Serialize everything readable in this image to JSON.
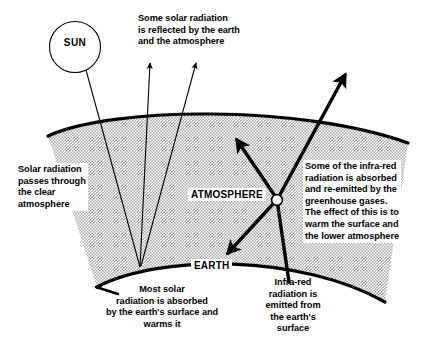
{
  "diagram": {
    "labels": {
      "sun": "SUN",
      "atmosphere": "ATMOSPHERE",
      "earth": "EARTH"
    },
    "annotations": {
      "top": "Some solar radiation\nis reflected by the earth\nand the atmosphere",
      "left": "Solar radiation\npasses through\nthe clear\natmosphere",
      "right": "Some of the infra-red\nradiation is absorbed\nand re-emitted by the\ngreenhouse gases.\nThe effect of this is to\nwarm the surface and\nthe lower atmosphere",
      "bottom_left": "Most solar\nradiation is absorbed\nby the earth's surface and\nwarms it",
      "bottom_right": "Infra-red\nradiation is\nemitted from\nthe earth's\nsurface"
    },
    "colors": {
      "ink": "#000000",
      "background": "#ffffff",
      "atmosphere_fill": "#c9c9c9",
      "node_fill": "#ffffff"
    }
  }
}
